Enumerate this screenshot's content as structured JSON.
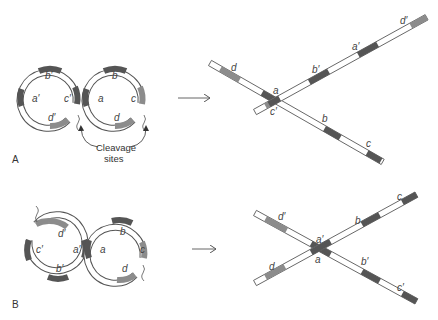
{
  "panels": [
    {
      "id": "A",
      "label": "A",
      "before": {
        "left_circle_labels": [
          "a′",
          "b′",
          "c′",
          "d′"
        ],
        "right_circle_labels": [
          "a",
          "b",
          "c",
          "d"
        ]
      },
      "annotation": {
        "line1": "Cleavage",
        "line2": "sites"
      },
      "after": {
        "strand1_labels": [
          "d",
          "a",
          "b",
          "c"
        ],
        "strand2_labels": [
          "c′",
          "b′",
          "a′",
          "d′"
        ]
      }
    },
    {
      "id": "B",
      "label": "B",
      "before": {
        "left_circle_labels": [
          "a′",
          "b′",
          "c′",
          "d′"
        ],
        "right_circle_labels": [
          "a",
          "b",
          "c",
          "d"
        ]
      },
      "after": {
        "strand1_labels": [
          "d′",
          "a′",
          "b′",
          "c′"
        ],
        "strand2_labels": [
          "d",
          "a",
          "b",
          "c"
        ]
      }
    }
  ],
  "colors": {
    "dark": "#555555",
    "mid": "#8c8c8c",
    "light": "#ffffff",
    "outline": "#555555"
  }
}
